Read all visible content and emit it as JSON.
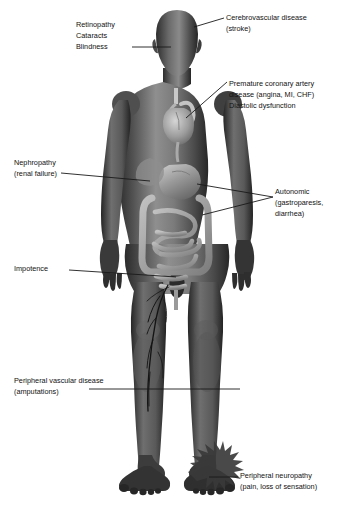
{
  "diagram": {
    "background_color": "#ffffff",
    "text_color": "#121212",
    "leader_line_color": "#1a1a1a",
    "figure_tone_dark": "#2a2a2a",
    "figure_tone_mid": "#6e6e6e",
    "figure_tone_light": "#a9a9a9"
  },
  "callouts": {
    "retinopathy": {
      "lines": [
        "Retinopathy",
        "Cataracts",
        "Blindness"
      ],
      "target": "eye"
    },
    "cerebrovascular": {
      "lines": [
        "Cerebrovascular disease",
        "(stroke)"
      ],
      "target": "brain"
    },
    "coronary": {
      "lines": [
        "Premature coronary artery",
        "disease (angina, MI, CHF)",
        "Diastolic dysfunction"
      ],
      "target": "heart"
    },
    "nephropathy": {
      "lines": [
        "Nephropathy",
        "(renal failure)"
      ],
      "target": "kidney"
    },
    "autonomic": {
      "lines": [
        "Autonomic",
        "(gastroparesis,",
        "diarrhea)"
      ],
      "target": "stomach-and-intestines"
    },
    "impotence": {
      "lines": [
        "Impotence"
      ],
      "target": "groin"
    },
    "peripheral_vascular": {
      "lines": [
        "Peripheral vascular disease",
        "(amputations)"
      ],
      "target": "leg-vessels"
    },
    "peripheral_neuropathy": {
      "lines": [
        "Peripheral neuropathy",
        "(pain, loss of sensation)"
      ],
      "target": "foot"
    }
  }
}
